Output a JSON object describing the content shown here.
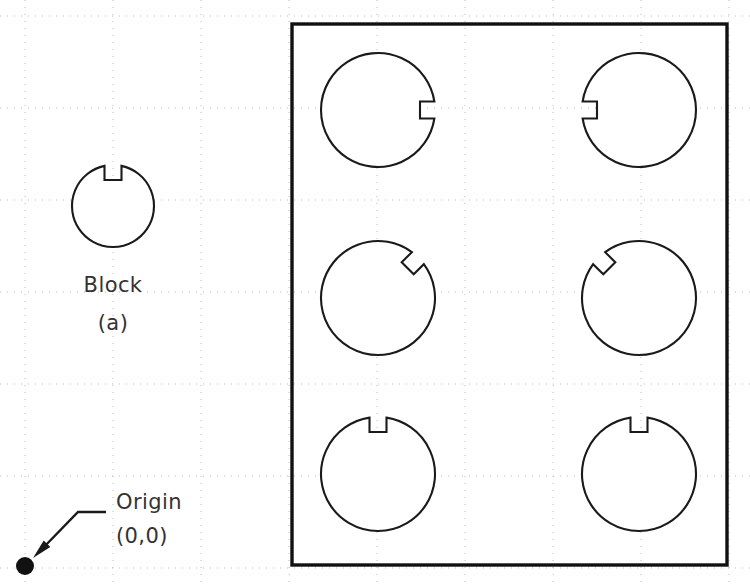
{
  "drawing": {
    "title": "Keyway block pattern layout",
    "canvas": {
      "width": 750,
      "height": 588,
      "background": "#ffffff"
    },
    "colors": {
      "grid": "#b9b9b9",
      "outline": "#1a1a1a",
      "boundary": "#111111",
      "text": "#333333",
      "origin_dot": "#111111"
    },
    "grid": {
      "style": "dotted",
      "x_origin": 25,
      "y_origin": 16,
      "x_spacing": 88,
      "y_spacing": 92,
      "x_lines": [
        25,
        113,
        201,
        289,
        377,
        465,
        553,
        641,
        729
      ],
      "y_lines": [
        16,
        108,
        200,
        292,
        384,
        476,
        568
      ]
    },
    "origin": {
      "label_name": "Origin",
      "label_coords": "(0,0)",
      "point": {
        "x": 25,
        "y": 566
      },
      "dot_radius": 9,
      "leader": {
        "elbow_x": 78,
        "elbow_y": 512,
        "end_x": 106,
        "arrow_tip_x": 33,
        "arrow_tip_y": 558
      }
    },
    "block_sample": {
      "caption": "Block",
      "sub_caption": "(a)",
      "center_x": 113,
      "center_y": 206,
      "radius": 41,
      "keyway_angle_deg": 270,
      "keyway_width": 17,
      "keyway_depth": 15,
      "caption_y": 292,
      "sub_caption_y": 330
    },
    "boundary": {
      "x": 292,
      "y": 24,
      "width": 435,
      "height": 541,
      "stroke_width": 3.4
    },
    "parts": {
      "radius": 57,
      "keyway_width": 17,
      "keyway_depth": 15,
      "columns_x": [
        378,
        639
      ],
      "rows_y": [
        110,
        298,
        474
      ],
      "items": [
        {
          "id": "part-r1c1",
          "row": 0,
          "col": 0,
          "cx": 378,
          "cy": 110,
          "keyway_angle_deg": 0,
          "keyway_direction": "east"
        },
        {
          "id": "part-r1c2",
          "row": 0,
          "col": 1,
          "cx": 639,
          "cy": 110,
          "keyway_angle_deg": 180,
          "keyway_direction": "west"
        },
        {
          "id": "part-r2c1",
          "row": 1,
          "col": 0,
          "cx": 378,
          "cy": 298,
          "keyway_angle_deg": 315,
          "keyway_direction": "northeast"
        },
        {
          "id": "part-r2c2",
          "row": 1,
          "col": 1,
          "cx": 639,
          "cy": 298,
          "keyway_angle_deg": 225,
          "keyway_direction": "northwest"
        },
        {
          "id": "part-r3c1",
          "row": 2,
          "col": 0,
          "cx": 378,
          "cy": 474,
          "keyway_angle_deg": 270,
          "keyway_direction": "north"
        },
        {
          "id": "part-r3c2",
          "row": 2,
          "col": 1,
          "cx": 639,
          "cy": 474,
          "keyway_angle_deg": 270,
          "keyway_direction": "north"
        }
      ]
    }
  }
}
